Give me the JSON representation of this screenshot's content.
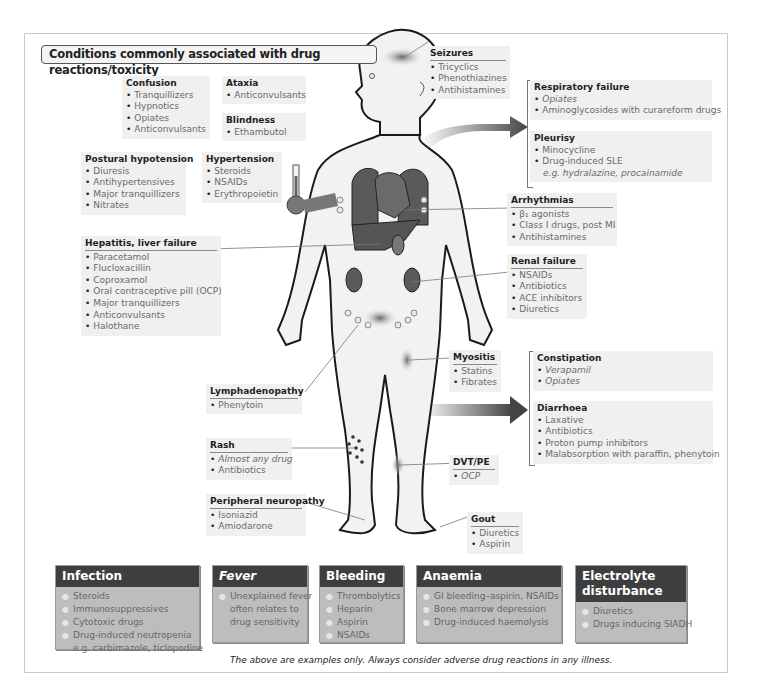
{
  "title": "Conditions commonly associated with drug reactions/toxicity",
  "conditions": {
    "confusion": {
      "heading": "Confusion",
      "items": [
        "Tranquillizers",
        "Hypnotics",
        "Opiates",
        "Anticonvulsants"
      ]
    },
    "ataxia": {
      "heading": "Ataxia",
      "items": [
        "Anticonvulsants"
      ]
    },
    "blindness": {
      "heading": "Blindness",
      "items": [
        "Ethambutol"
      ]
    },
    "postural_hypotension": {
      "heading": "Postural hypotension",
      "items": [
        "Diuresis",
        "Antihypertensives",
        "Major tranquillizers",
        "Nitrates"
      ]
    },
    "hypertension": {
      "heading": "Hypertension",
      "items": [
        "Steroids",
        "NSAIDs",
        "Erythropoietin"
      ]
    },
    "hepatitis": {
      "heading": "Hepatitis, liver failure",
      "items": [
        "Paracetamol",
        "Flucloxacillin",
        "Coproxamol",
        "Oral contraceptive pill (OCP)",
        "Major tranquillizers",
        "Anticonvulsants",
        "Halothane"
      ]
    },
    "seizures": {
      "heading": "Seizures",
      "items": [
        "Tricyclics",
        "Phenothiazines",
        "Antihistamines"
      ]
    },
    "respiratory_failure": {
      "heading": "Respiratory failure",
      "items": [
        "Opiates",
        "Aminoglycosides with curareform drugs"
      ]
    },
    "pleurisy": {
      "heading": "Pleurisy",
      "items": [
        "Minocycline",
        "Drug-induced SLE",
        "e.g. hydralazine, procainamide"
      ]
    },
    "arrhythmias": {
      "heading": "Arrhythmias",
      "items": [
        "β₁ agonists",
        "Class I drugs, post MI",
        "Antihistamines"
      ]
    },
    "renal_failure": {
      "heading": "Renal failure",
      "items": [
        "NSAIDs",
        "Antibiotics",
        "ACE inhibitors",
        "Diuretics"
      ]
    },
    "myositis": {
      "heading": "Myositis",
      "items": [
        "Statins",
        "Fibrates"
      ]
    },
    "constipation": {
      "heading": "Constipation",
      "items": [
        "Verapamil",
        "Opiates"
      ]
    },
    "diarrhoea": {
      "heading": "Diarrhoea",
      "items": [
        "Laxative",
        "Antibiotics",
        "Proton pump inhibitors",
        "Malabsorption with paraffin, phenytoin"
      ]
    },
    "lymphadenopathy": {
      "heading": "Lymphadenopathy",
      "items": [
        "Phenytoin"
      ]
    },
    "rash": {
      "heading": "Rash",
      "items": [
        "Almost any drug",
        "Antibiotics"
      ]
    },
    "dvt_pe": {
      "heading": "DVT/PE",
      "items": [
        "OCP"
      ]
    },
    "peripheral_neuropathy": {
      "heading": "Peripheral neuropathy",
      "items": [
        "Isoniazid",
        "Amiodarone"
      ]
    },
    "gout": {
      "heading": "Gout",
      "items": [
        "Diuretics",
        "Aspirin"
      ]
    }
  },
  "systemic": {
    "infection": {
      "heading": "Infection",
      "items": [
        "Steroids",
        "Immunosuppressives",
        "Cytotoxic drugs",
        "Drug-induced neutropenia",
        "e.g. carbimazole, ticlopodine"
      ]
    },
    "fever": {
      "heading": "Fever",
      "items": [
        "Unexplained fever",
        "often relates to",
        "drug sensitivity"
      ]
    },
    "bleeding": {
      "heading": "Bleeding",
      "items": [
        "Thrombolytics",
        "Heparin",
        "Aspirin",
        "NSAIDs"
      ]
    },
    "anaemia": {
      "heading": "Anaemia",
      "items": [
        "GI bleeding–aspirin, NSAIDs",
        "Bone marrow depression",
        "Drug-induced haemolysis"
      ]
    },
    "electrolyte": {
      "heading_line1": "Electrolyte",
      "heading_line2": "disturbance",
      "items": [
        "Diuretics",
        "Drugs inducing SIADH"
      ]
    }
  },
  "footnote": "The above are examples only. Always consider adverse drug reactions in any illness.",
  "colors": {
    "organ": "#5a5a5a",
    "body_fill": "#f2f2f2",
    "body_outline": "#1a1a1a",
    "box_header": "#3e3e3e",
    "box_body": "#bdbdbd",
    "label_bg": "#f0f0f0"
  }
}
